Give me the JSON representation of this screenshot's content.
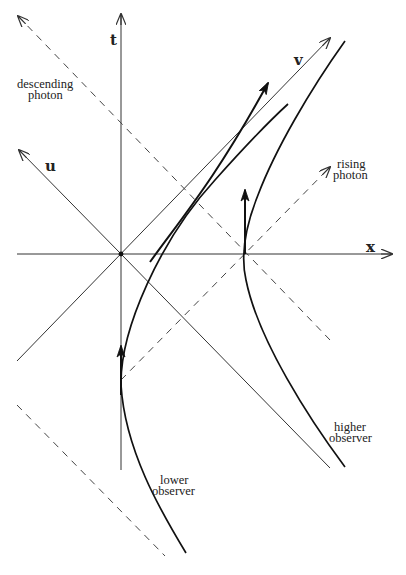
{
  "diagram": {
    "axes": {
      "t": "t",
      "x": "x",
      "u": "u",
      "v": "v"
    },
    "labels": {
      "descending_photon_line1": "descending",
      "descending_photon_line2": "photon",
      "rising_photon_line1": "rising",
      "rising_photon_line2": "photon",
      "higher_observer_line1": "higher",
      "higher_observer_line2": "observer",
      "lower_observer_line1": "lower",
      "lower_observer_line2": "observer"
    },
    "colors": {
      "stroke": "#333333",
      "worldline": "#111111",
      "background": "#ffffff"
    },
    "origin": [
      121,
      254
    ]
  }
}
